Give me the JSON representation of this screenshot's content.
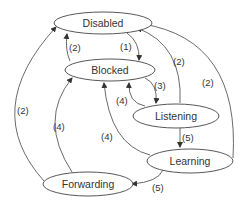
{
  "diagram": {
    "nodes": [
      {
        "id": "disabled",
        "label": "Disabled"
      },
      {
        "id": "blocked",
        "label": "Blocked"
      },
      {
        "id": "listening",
        "label": "Listening"
      },
      {
        "id": "learning",
        "label": "Learning"
      },
      {
        "id": "forwarding",
        "label": "Forwarding"
      }
    ],
    "edges": [
      {
        "from": "disabled",
        "to": "blocked",
        "label": "(1)"
      },
      {
        "from": "blocked",
        "to": "disabled",
        "label": "(2)"
      },
      {
        "from": "listening",
        "to": "disabled",
        "label": "(2)"
      },
      {
        "from": "learning",
        "to": "disabled",
        "label": "(2)"
      },
      {
        "from": "forwarding",
        "to": "disabled",
        "label": "(2)"
      },
      {
        "from": "blocked",
        "to": "listening",
        "label": "(3)"
      },
      {
        "from": "listening",
        "to": "blocked",
        "label": "(4)"
      },
      {
        "from": "learning",
        "to": "blocked",
        "label": "(4)"
      },
      {
        "from": "forwarding",
        "to": "blocked",
        "label": "(4)"
      },
      {
        "from": "listening",
        "to": "learning",
        "label": "(5)"
      },
      {
        "from": "learning",
        "to": "forwarding",
        "label": "(5)"
      }
    ]
  }
}
